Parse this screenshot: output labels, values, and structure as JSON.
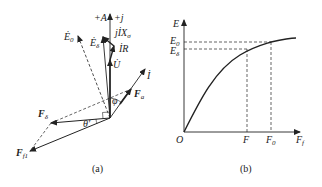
{
  "figure_a": {
    "caption": "(a)",
    "labels": {
      "plus_A": "+A",
      "plus_j": "+j",
      "jIX": "jİX",
      "jIX_sub": "σ",
      "IR": "İR",
      "E0": "Ė",
      "E0_sub": "0",
      "Ed": "Ė",
      "Ed_sub": "δ",
      "U": "U̇",
      "I": "İ",
      "Fa": "F",
      "Fa_sub": "a",
      "Fd": "F",
      "Fd_sub": "δ",
      "Ff1": "F",
      "Ff1_sub": "f1",
      "phi": "φ",
      "theta": "θ′"
    }
  },
  "figure_b": {
    "caption": "(b)",
    "labels": {
      "y_axis": "E",
      "E0": "E",
      "E0_sub": "0",
      "Ed": "E",
      "Ed_sub": "δ",
      "origin": "O",
      "F": "F",
      "F0": "F",
      "F0_sub": "0",
      "x_axis": "F",
      "x_axis_sub": "f"
    }
  }
}
